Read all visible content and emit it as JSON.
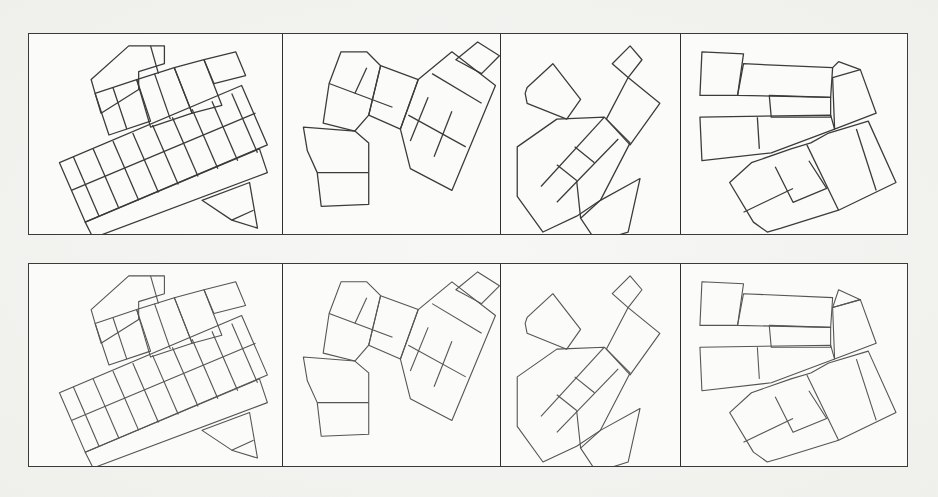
{
  "figure": {
    "rows": [
      {
        "id": "top",
        "panels": [
          {
            "id": "a1",
            "content": "dense grid of tilted rectangles with trapezoid top and triangle at lower right"
          },
          {
            "id": "b1",
            "content": "two clusters of quadrilaterals: left pentagon column and right rotated grid"
          },
          {
            "id": "c1",
            "content": "diagonal chain of rotated rectangles with detached rectangle top-left and small square top-right"
          },
          {
            "id": "d1",
            "content": "horizontal strips of rectangles with rotated block cluster bottom-right"
          }
        ]
      },
      {
        "id": "bottom",
        "panels": [
          {
            "id": "a2",
            "content": "same layout as a1 with lighter strokes"
          },
          {
            "id": "b2",
            "content": "same layout as b1 with lighter strokes"
          },
          {
            "id": "c2",
            "content": "same layout as c1 with lighter strokes"
          },
          {
            "id": "d2",
            "content": "same layout as d1 with lighter strokes"
          }
        ]
      }
    ]
  },
  "colors": {
    "stroke_primary": "#3b3b3b",
    "stroke_secondary": "#555555",
    "frame": "#3a3a3a",
    "background": "#f4f4f2"
  }
}
